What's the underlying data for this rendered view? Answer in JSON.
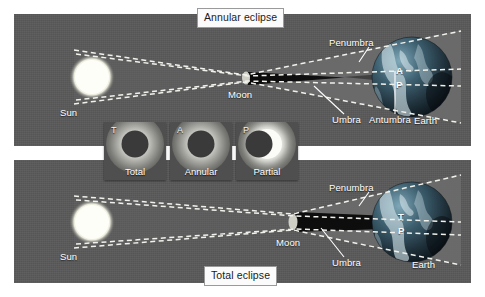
{
  "figure": {
    "background_color": "#ffffff",
    "panel_color": "#595959"
  },
  "panels": [
    {
      "id": "annular",
      "caption": "Annular eclipse",
      "bodies": {
        "sun_label": "Sun",
        "moon_label": "Moon",
        "earth_label": "Earth"
      },
      "shadow_labels": [
        {
          "name": "Penumbra",
          "text": "Penumbra"
        },
        {
          "name": "Umbra",
          "text": "Umbra"
        },
        {
          "name": "Antumbra",
          "text": "Antumbra"
        }
      ],
      "surface_markers": [
        {
          "code": "A",
          "meaning": "Annular"
        },
        {
          "code": "P",
          "meaning": "Partial"
        }
      ]
    },
    {
      "id": "total",
      "caption": "Total eclipse",
      "bodies": {
        "sun_label": "Sun",
        "moon_label": "Moon",
        "earth_label": "Earth"
      },
      "shadow_labels": [
        {
          "name": "Penumbra",
          "text": "Penumbra"
        },
        {
          "name": "Umbra",
          "text": "Umbra"
        }
      ],
      "surface_markers": [
        {
          "code": "T",
          "meaning": "Total"
        },
        {
          "code": "P",
          "meaning": "Partial"
        }
      ]
    }
  ],
  "photo_strip": [
    {
      "code": "T",
      "label": "Total"
    },
    {
      "code": "A",
      "label": "Annular"
    },
    {
      "code": "P",
      "label": "Partial"
    }
  ],
  "colors": {
    "penumbra": "#6a6a6a",
    "umbra": "#141414",
    "antumbra": "#3b3b3b",
    "ray": "#f0f0ea",
    "sun": "#fdfdf6",
    "earth_dark": "#1d2a33",
    "earth_light": "#cfe0e6"
  }
}
